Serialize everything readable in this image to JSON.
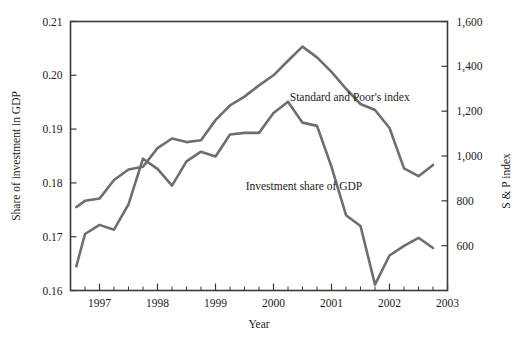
{
  "chart_data": {
    "type": "line",
    "title": "",
    "xlabel": "Year",
    "ylabel": "Share of investment in GDP",
    "y2label": "S & P index",
    "grid": false,
    "legend_position": "inline-annotations",
    "xlim": [
      1996.5,
      2003.0
    ],
    "ylim": [
      0.16,
      0.21
    ],
    "y2lim": [
      400,
      1600
    ],
    "xticks_major": [
      1997,
      1998,
      1999,
      2000,
      2001,
      2002,
      2003
    ],
    "xtick_labels": [
      "1997",
      "1998",
      "1999",
      "2000",
      "2001",
      "2002",
      "2003"
    ],
    "xticks_minor_per_year": 4,
    "yticks": [
      0.16,
      0.17,
      0.18,
      0.19,
      0.2,
      0.21
    ],
    "ytick_labels": [
      "0.16",
      "0.17",
      "0.18",
      "0.19",
      "0.20",
      "0.21"
    ],
    "y2ticks": [
      600,
      800,
      1000,
      1200,
      1400,
      1600
    ],
    "y2tick_labels": [
      "600",
      "800",
      "1,000",
      "1,200",
      "1,400",
      "1,600"
    ],
    "line_color": "#6e6e6e",
    "axis_color": "#3a3a3a",
    "series": [
      {
        "name": "Standard and Poor's index",
        "axis": "right",
        "annotation": "Standard and Poor's index",
        "annotation_x": 2000.28,
        "annotation_y": 1245,
        "x": [
          1996.6,
          1996.75,
          1997.0,
          1997.25,
          1997.5,
          1997.75,
          1998.0,
          1998.25,
          1998.5,
          1998.75,
          1999.0,
          1999.25,
          1999.5,
          1999.75,
          2000.0,
          2000.25,
          2000.5,
          2000.75,
          2001.0,
          2001.25,
          2001.5,
          2001.75,
          2002.0,
          2002.25,
          2002.5,
          2002.75
        ],
        "y": [
          772,
          800,
          810,
          893,
          940,
          952,
          1035,
          1078,
          1062,
          1070,
          1160,
          1226,
          1265,
          1315,
          1360,
          1425,
          1488,
          1440,
          1375,
          1300,
          1232,
          1205,
          1125,
          945,
          910,
          960
        ],
        "y_left_equiv": [
          0.1795,
          0.181,
          0.1815,
          0.1857,
          0.1882,
          0.1888,
          0.193,
          0.1952,
          0.1943,
          0.1948,
          0.1992,
          0.2026,
          0.2046,
          0.2071,
          0.2094,
          0.2127,
          0.206,
          0.2036,
          0.2002,
          0.1964,
          0.193,
          0.1916,
          0.1875,
          0.1784,
          0.1766,
          0.1792
        ]
      },
      {
        "name": "Investment share of GDP",
        "axis": "left",
        "annotation": "Investment share of GDP",
        "annotation_x": 1999.52,
        "annotation_y": 0.1787,
        "x": [
          1996.6,
          1996.75,
          1997.0,
          1997.25,
          1997.5,
          1997.75,
          1998.0,
          1998.25,
          1998.5,
          1998.75,
          1999.0,
          1999.25,
          1999.5,
          1999.75,
          2000.0,
          2000.25,
          2000.5,
          2000.75,
          2001.0,
          2001.25,
          2001.5,
          2001.75,
          2002.0,
          2002.25,
          2002.5,
          2002.75
        ],
        "y": [
          0.1645,
          0.1705,
          0.1722,
          0.1713,
          0.176,
          0.1845,
          0.1826,
          0.1795,
          0.184,
          0.1858,
          0.1849,
          0.189,
          0.1893,
          0.1893,
          0.193,
          0.1951,
          0.1912,
          0.1906,
          0.183,
          0.174,
          0.172,
          0.1611,
          0.1665,
          0.1683,
          0.1698,
          0.1679
        ]
      }
    ]
  },
  "axes": {
    "left_title": "Share of investment in GDP",
    "right_title": "S & P index",
    "bottom_title": "Year"
  }
}
